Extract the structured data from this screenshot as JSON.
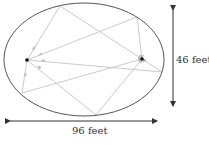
{
  "diagram": {
    "type": "elliptical-whispering-gallery",
    "ellipse": {
      "cx": 84,
      "cy": 59.5,
      "rx": 80,
      "ry": 56.5,
      "stroke": "#555555"
    },
    "foci": [
      {
        "name": "left-focus",
        "x": 27,
        "y": 60
      },
      {
        "name": "right-focus",
        "x": 142,
        "y": 59
      }
    ],
    "ray_color": "#c0c0c0",
    "reflection_points": [
      {
        "x": 60,
        "y": 6
      },
      {
        "x": 137,
        "y": 17
      },
      {
        "x": 162,
        "y": 72
      },
      {
        "x": 96,
        "y": 115
      },
      {
        "x": 22,
        "y": 93
      }
    ],
    "dimensions": {
      "height_label": "46 feet",
      "width_label": "96 feet"
    }
  }
}
